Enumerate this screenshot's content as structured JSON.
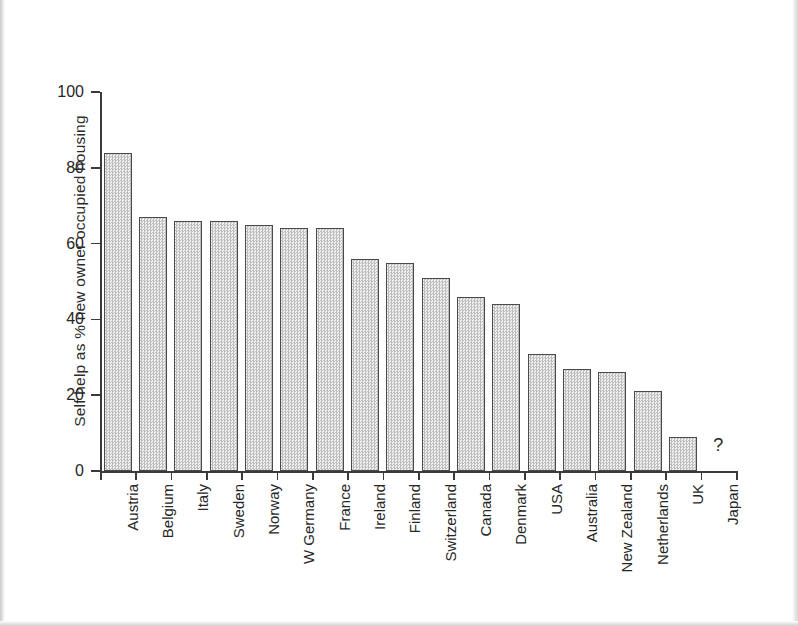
{
  "chart_data": {
    "type": "bar",
    "title": "",
    "xlabel": "",
    "ylabel": "Self help as % new owner occupied housing",
    "ylim": [
      0,
      100
    ],
    "yticks": [
      0,
      20,
      40,
      60,
      80,
      100
    ],
    "grid": false,
    "legend": null,
    "categories": [
      "Austria",
      "Belgium",
      "Italy",
      "Sweden",
      "Norway",
      "W Germany",
      "France",
      "Ireland",
      "Finland",
      "Switzerland",
      "Canada",
      "Denmark",
      "USA",
      "Australia",
      "New Zealand",
      "Netherlands",
      "UK",
      "Japan"
    ],
    "values": [
      84,
      67,
      66,
      66,
      65,
      64,
      64,
      56,
      55,
      51,
      46,
      44,
      31,
      27,
      26,
      21,
      9,
      null
    ],
    "annotations": [
      {
        "category": "Japan",
        "text": "?",
        "note": "no data bar drawn"
      }
    ]
  },
  "colors": {
    "bar_fill": "#d9d9d9",
    "bar_edge": "#4a4a4a",
    "axis": "#3a3a3a",
    "text": "#262626",
    "background": "#ffffff"
  }
}
